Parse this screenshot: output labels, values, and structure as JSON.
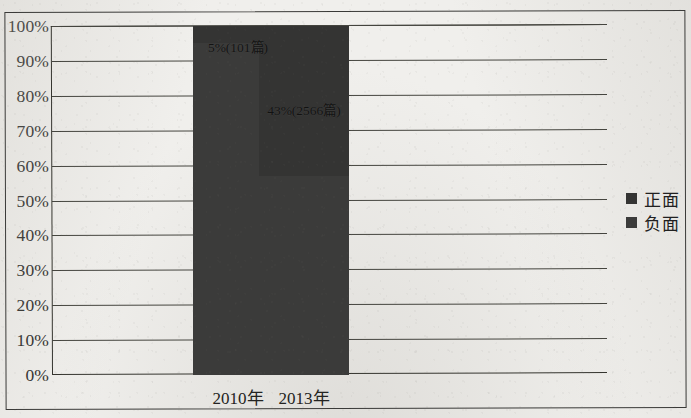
{
  "chart_data": {
    "type": "bar",
    "subtype": "100% stacked column",
    "title": "",
    "subtitle": "",
    "xlabel": "",
    "ylabel": "",
    "categories": [
      "2010年",
      "2013年"
    ],
    "ylim": [
      0,
      100
    ],
    "yunit": "%",
    "ytick_labels": [
      "0%",
      "10%",
      "20%",
      "30%",
      "40%",
      "50%",
      "60%",
      "70%",
      "80%",
      "90%",
      "100%"
    ],
    "ytick_values": [
      0,
      10,
      20,
      30,
      40,
      50,
      60,
      70,
      80,
      90,
      100
    ],
    "grid": "horizontal",
    "legend_position": "right",
    "series": [
      {
        "name": "正面",
        "color": "#343433",
        "values": [
          5,
          43
        ],
        "value_labels": [
          "5%(101篇)",
          "43%(2566篇)"
        ]
      },
      {
        "name": "负面",
        "color": "#3b3b3a",
        "values": [
          95,
          57
        ],
        "value_labels": [
          "",
          ""
        ]
      }
    ],
    "annotations": [
      {
        "text": "5%(101篇)",
        "category": "2010年",
        "series": "正面",
        "percent": 5,
        "count": 101,
        "y_percent": 97,
        "legible": "low"
      },
      {
        "text": "43%(2566篇)",
        "category": "2013年",
        "series": "正面",
        "percent": 43,
        "count": 2566,
        "y_percent": 79,
        "legible": "low"
      }
    ]
  },
  "legend": {
    "items": [
      {
        "label": "正面",
        "color": "#343433"
      },
      {
        "label": "负面",
        "color": "#3b3b3a"
      }
    ]
  },
  "axes": {
    "y": {
      "ticks": [
        "100%",
        "90%",
        "80%",
        "70%",
        "60%",
        "50%",
        "40%",
        "30%",
        "20%",
        "10%",
        "0%"
      ]
    },
    "x": {
      "ticks": [
        "2010年",
        "2013年"
      ]
    }
  }
}
